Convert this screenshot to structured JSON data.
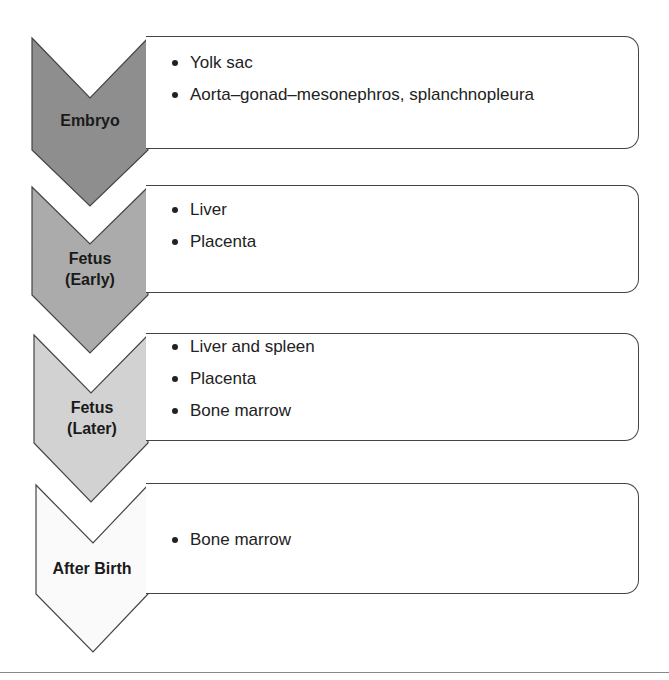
{
  "stages": [
    {
      "label_line1": "Embryo",
      "label_line2": "",
      "fill": "#8e8e8e",
      "items": [
        "Yolk sac",
        "Aorta–gonad–mesonephros, splanchnopleura"
      ]
    },
    {
      "label_line1": "Fetus",
      "label_line2": "(Early)",
      "fill": "#ababab",
      "items": [
        "Liver",
        "Placenta"
      ]
    },
    {
      "label_line1": "Fetus",
      "label_line2": "(Later)",
      "fill": "#d2d2d2",
      "items": [
        "Liver and spleen",
        "Placenta",
        "Bone marrow"
      ]
    },
    {
      "label_line1": "After Birth",
      "label_line2": "",
      "fill": "#fafafa",
      "items": [
        "Bone marrow"
      ]
    }
  ],
  "colors": {
    "stroke": "#444444",
    "text": "#222222"
  }
}
